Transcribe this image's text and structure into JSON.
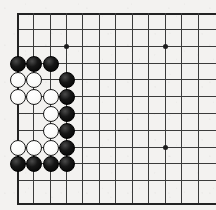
{
  "board": {
    "title": "Go board position",
    "type": "go-board",
    "background_color": "#f3f2f0",
    "line_color": "#3b3b3b",
    "edge_line_color": "#232323",
    "black_stone_color": "#000000",
    "white_stone_color": "#fbfbfa",
    "visible_columns": 12,
    "visible_rows": 12,
    "cell_size_px": 16.4,
    "origin_x_px": 17,
    "origin_y_px": 13,
    "stone_diameter_px": 16,
    "star_point_label": "hoshi",
    "star_points": [
      {
        "col": 4,
        "row": 3
      },
      {
        "col": 10,
        "row": 3
      },
      {
        "col": 10,
        "row": 9
      }
    ],
    "vertical_lines_x": [
      17,
      33,
      50,
      66,
      82,
      99,
      115,
      132,
      148,
      165,
      181,
      198
    ],
    "horizontal_lines_y": [
      13,
      29,
      46,
      63,
      79,
      96,
      113,
      130,
      147,
      163,
      180,
      203
    ],
    "edges": {
      "left": true,
      "top": true,
      "bottom": true,
      "right": false
    },
    "stones": [
      {
        "color": "black",
        "col": 1,
        "row": 4
      },
      {
        "color": "black",
        "col": 2,
        "row": 4
      },
      {
        "color": "black",
        "col": 3,
        "row": 4
      },
      {
        "color": "white",
        "col": 1,
        "row": 5
      },
      {
        "color": "white",
        "col": 2,
        "row": 5
      },
      {
        "color": "black",
        "col": 4,
        "row": 5
      },
      {
        "color": "white",
        "col": 1,
        "row": 6
      },
      {
        "color": "white",
        "col": 2,
        "row": 6
      },
      {
        "color": "white",
        "col": 3,
        "row": 6
      },
      {
        "color": "black",
        "col": 4,
        "row": 6
      },
      {
        "color": "white",
        "col": 3,
        "row": 7
      },
      {
        "color": "black",
        "col": 4,
        "row": 7
      },
      {
        "color": "white",
        "col": 3,
        "row": 8
      },
      {
        "color": "black",
        "col": 4,
        "row": 8
      },
      {
        "color": "white",
        "col": 1,
        "row": 9
      },
      {
        "color": "white",
        "col": 2,
        "row": 9
      },
      {
        "color": "white",
        "col": 3,
        "row": 9
      },
      {
        "color": "black",
        "col": 4,
        "row": 9
      },
      {
        "color": "black",
        "col": 1,
        "row": 10
      },
      {
        "color": "black",
        "col": 2,
        "row": 10
      },
      {
        "color": "black",
        "col": 3,
        "row": 10
      },
      {
        "color": "black",
        "col": 4,
        "row": 10
      }
    ],
    "counts": {
      "black_stones": 13,
      "white_stones": 9,
      "total_stones": 22
    }
  }
}
